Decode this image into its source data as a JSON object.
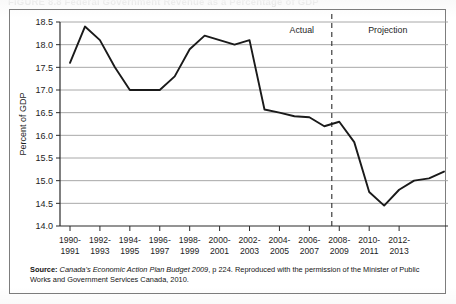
{
  "figure": {
    "title": "FIGURE 8.8   Federal Government Revenue as a Percentage of GDP"
  },
  "source": {
    "label": "Source:",
    "italic_part": "Canada's Economic Action Plan Budget 2009",
    "rest": ", p 224. Reproduced with the permission of the Minister of Public Works and Government Services Canada, 2010."
  },
  "annotations": {
    "actual": "Actual",
    "projection": "Projection"
  },
  "chart_data": {
    "type": "line",
    "title": "Federal Government Revenue as a Percentage of GDP",
    "xlabel": "",
    "ylabel": "Percent of GDP",
    "ylim": [
      14.0,
      18.5
    ],
    "ytick_labels": [
      "14.0",
      "14.5",
      "15.0",
      "15.5",
      "16.0",
      "16.5",
      "17.0",
      "17.5",
      "18.0",
      "18.5"
    ],
    "ytick_values": [
      14.0,
      14.5,
      15.0,
      15.5,
      16.0,
      16.5,
      17.0,
      17.5,
      18.0,
      18.5
    ],
    "grid": "horizontal",
    "legend": "none",
    "xtick_labels": [
      "1990-\n1991",
      "1992-\n1993",
      "1994-\n1995",
      "1996-\n1997",
      "1998-\n1999",
      "2000-\n2001",
      "2002-\n2003",
      "2004-\n2005",
      "2006-\n2007",
      "2008-\n2009",
      "2010-\n2011",
      "2012-\n2013"
    ],
    "xtick_labels_top": [
      "1990-",
      "1992-",
      "1994-",
      "1996-",
      "1998-",
      "2000-",
      "2002-",
      "2004-",
      "2006-",
      "2008-",
      "2010-",
      "2012-"
    ],
    "xtick_labels_bottom": [
      "1991",
      "1993",
      "1995",
      "1997",
      "1999",
      "2001",
      "2003",
      "2005",
      "2007",
      "2009",
      "2011",
      "2013"
    ],
    "xtick_indices": [
      0,
      2,
      4,
      6,
      8,
      10,
      12,
      14,
      16,
      18,
      20,
      22
    ],
    "categories": [
      "1990-1991",
      "1991-1992",
      "1992-1993",
      "1993-1994",
      "1994-1995",
      "1995-1996",
      "1996-1997",
      "1997-1998",
      "1998-1999",
      "1999-2000",
      "2000-2001",
      "2001-2002",
      "2002-2003",
      "2003-2004",
      "2004-2005",
      "2005-2006",
      "2006-2007",
      "2007-2008",
      "2008-2009",
      "2009-2010",
      "2010-2011",
      "2011-2012",
      "2012-2013",
      "2013-2014"
    ],
    "values": [
      17.6,
      18.4,
      18.1,
      17.5,
      17.0,
      17.0,
      17.0,
      17.3,
      17.9,
      18.2,
      18.1,
      18.0,
      18.1,
      16.57,
      16.5,
      16.42,
      16.4,
      16.2,
      16.3,
      15.85,
      14.75,
      14.45,
      14.8,
      15.0
    ],
    "tail_values": [
      15.05,
      15.2
    ],
    "divider": {
      "label_left": "Actual",
      "label_right": "Projection",
      "at_category": "2007-2008",
      "style": "dashed"
    },
    "line_color": "#1a1a1a",
    "grid_color": "#9e9e9e",
    "axis_color": "#2b2b2b"
  }
}
